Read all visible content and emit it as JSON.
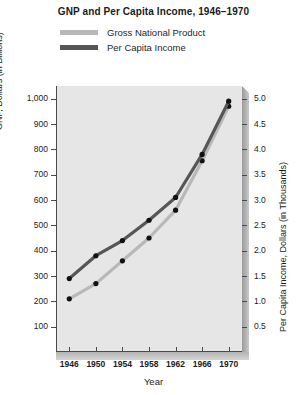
{
  "chart_data": {
    "type": "line",
    "title": "GNP and Per Capita Income, 1946–1970",
    "xlabel": "Year",
    "ylabel": "GNP, Dollars (in Billions)",
    "y2label": "Per Capita Income, Dollars (in Thousands)",
    "categories": [
      1946,
      1950,
      1954,
      1958,
      1962,
      1966,
      1970
    ],
    "xticklabels": [
      "1946",
      "1950",
      "1954",
      "1958",
      "1962",
      "1966",
      "1970"
    ],
    "xlim": [
      1944,
      1972
    ],
    "ylim": [
      0,
      1050
    ],
    "yticks": [
      100,
      200,
      300,
      400,
      500,
      600,
      700,
      800,
      900,
      1000
    ],
    "yticklabels": [
      "100",
      "200",
      "300",
      "400",
      "500",
      "600",
      "700",
      "800",
      "900",
      "1,000"
    ],
    "y2lim": [
      0,
      5.25
    ],
    "y2ticks": [
      0.5,
      1.0,
      1.5,
      2.0,
      2.5,
      3.0,
      3.5,
      4.0,
      4.5,
      5.0
    ],
    "y2ticklabels": [
      "0.5",
      "1.0",
      "1.5",
      "2.0",
      "2.5",
      "3.0",
      "3.5",
      "4.0",
      "4.5",
      "5.0"
    ],
    "grid": false,
    "legend_position": "above-plot",
    "series": [
      {
        "name": "Gross National Product",
        "axis": "left",
        "color": "#b8b8b8",
        "marker_color": "#111111",
        "values": [
          210,
          270,
          360,
          450,
          560,
          755,
          970
        ]
      },
      {
        "name": "Per Capita Income",
        "axis": "right",
        "color": "#565656",
        "marker_color": "#111111",
        "values": [
          1.45,
          1.9,
          2.2,
          2.6,
          3.05,
          3.9,
          4.95
        ]
      }
    ]
  },
  "legend": {
    "items": [
      {
        "label": "Gross National Product",
        "swatch": "#b8b8b8"
      },
      {
        "label": "Per Capita Income",
        "swatch": "#565656"
      }
    ]
  }
}
